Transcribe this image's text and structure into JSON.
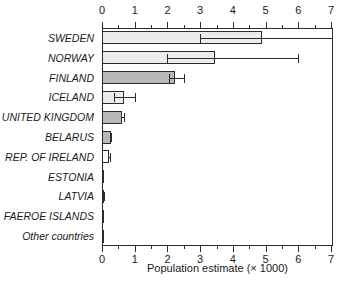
{
  "chart_data": {
    "type": "bar",
    "orientation": "horizontal",
    "title": "",
    "xlabel": "Population estimate (× 1000)",
    "ylabel": "",
    "xlim": [
      0,
      7.06
    ],
    "xticks": [
      0,
      1,
      2,
      3,
      4,
      5,
      6,
      7
    ],
    "xtick_labels": [
      "0",
      "1",
      "2",
      "3",
      "4",
      "5",
      "6",
      "7"
    ],
    "minor_ticks": [
      0.5,
      1.5,
      2.5,
      3.5,
      4.5,
      5.5,
      6.5
    ],
    "grid": false,
    "legend": "none",
    "axis_on_top": true,
    "axis_on_bottom": true,
    "categories": [
      "SWEDEN",
      "NORWAY",
      "FINLAND",
      "ICELAND",
      "UNITED KINGDOM",
      "BELARUS",
      "REP. OF IRELAND",
      "ESTONIA",
      "LATVIA",
      "FAEROE ISLANDS",
      "Other countries"
    ],
    "values": [
      4.9,
      3.45,
      2.22,
      0.68,
      0.62,
      0.26,
      0.22,
      0.06,
      0.05,
      0.01,
      0.005
    ],
    "error_low": [
      3.0,
      2.0,
      2.05,
      0.36,
      0.58,
      0.25,
      0.19,
      null,
      0.04,
      null,
      null
    ],
    "error_high": [
      7.06,
      6.0,
      2.52,
      1.0,
      0.66,
      0.27,
      0.25,
      null,
      0.06,
      null,
      null
    ],
    "bar_fills": [
      "#ececec",
      "#ececec",
      "#b8b8b8",
      "#ececec",
      "#b8b8b8",
      "#b8b8b8",
      "#ffffff",
      "#141414",
      "#4a4a4a",
      "#ffffff",
      "#ffffff"
    ],
    "bar_edge_color": "#2b2b2b",
    "error_color": "#2b2b2b",
    "background": "#ffffff"
  }
}
